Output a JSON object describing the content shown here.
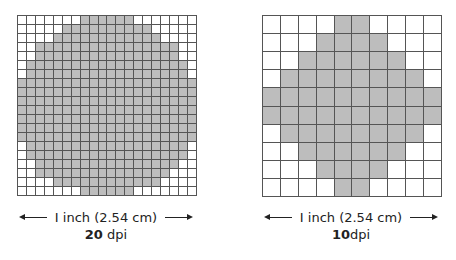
{
  "panels": [
    {
      "id": "20dpi",
      "size": 20,
      "dpi_value": "20",
      "dpi_unit": "dpi",
      "caption": "I inch (2.54 cm)",
      "rows": [
        [
          7,
          12
        ],
        [
          5,
          14
        ],
        [
          4,
          15
        ],
        [
          2,
          17
        ],
        [
          2,
          17
        ],
        [
          1,
          18
        ],
        [
          1,
          18
        ],
        [
          0,
          19
        ],
        [
          0,
          19
        ],
        [
          0,
          19
        ],
        [
          0,
          19
        ],
        [
          0,
          19
        ],
        [
          0,
          19
        ],
        [
          0,
          19
        ],
        [
          1,
          18
        ],
        [
          1,
          18
        ],
        [
          2,
          17
        ],
        [
          2,
          16
        ],
        [
          4,
          15
        ],
        [
          7,
          12
        ]
      ]
    },
    {
      "id": "10dpi",
      "size": 10,
      "dpi_value": "10",
      "dpi_unit": "dpi",
      "caption": "I inch (2.54 cm)",
      "rows": [
        [
          4,
          5
        ],
        [
          3,
          6
        ],
        [
          2,
          7
        ],
        [
          1,
          8
        ],
        [
          0,
          9
        ],
        [
          0,
          9
        ],
        [
          1,
          8
        ],
        [
          2,
          7
        ],
        [
          3,
          6
        ],
        [
          4,
          5
        ]
      ]
    }
  ],
  "colors": {
    "fill": "#bdbdbd",
    "grid": "#555555"
  }
}
